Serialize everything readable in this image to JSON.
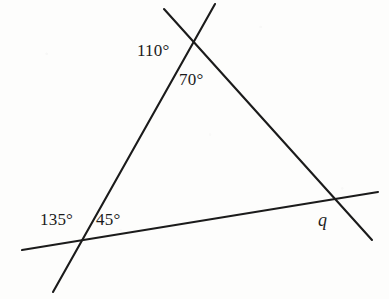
{
  "figure": {
    "kind": "geometry-diagram",
    "width": 389,
    "height": 299,
    "background_color": "#fdfdfc",
    "stroke_color": "#1b1b1b",
    "stroke_width": 2.1
  },
  "points": {
    "apex": {
      "x": 193,
      "y": 48
    },
    "bottom_left_vertex": {
      "x": 80,
      "y": 240
    },
    "right_vertex": {
      "x": 331,
      "y": 200
    },
    "left_line_top_end": {
      "x": 215,
      "y": 4
    },
    "left_line_bottom_end": {
      "x": 53,
      "y": 292
    },
    "right_line_top_end": {
      "x": 164,
      "y": 9
    },
    "right_line_bottom_end": {
      "x": 372,
      "y": 240
    },
    "base_line_left_end": {
      "x": 22,
      "y": 250
    },
    "base_line_right_end": {
      "x": 378,
      "y": 192
    }
  },
  "lines": [
    {
      "name": "left-transversal",
      "description": "steep line from upper right through apex down to lower left",
      "x1": 215,
      "y1": 4,
      "x2": 53,
      "y2": 292
    },
    {
      "name": "right-transversal",
      "description": "line from upper left through apex down to lower right",
      "x1": 164,
      "y1": 9,
      "x2": 372,
      "y2": 240
    },
    {
      "name": "base-transversal",
      "description": "near horizontal line rising slightly to the right",
      "x1": 22,
      "y1": 250,
      "x2": 378,
      "y2": 192
    }
  ],
  "labels": {
    "angle_110": {
      "text": "110°",
      "value": 110,
      "unit": "degrees",
      "x": 137,
      "y": 42
    },
    "angle_70": {
      "text": "70°",
      "value": 70,
      "unit": "degrees",
      "x": 179,
      "y": 71
    },
    "angle_135": {
      "text": "135°",
      "value": 135,
      "unit": "degrees",
      "x": 40,
      "y": 211
    },
    "angle_45": {
      "text": "45°",
      "value": 45,
      "unit": "degrees",
      "x": 96,
      "y": 211
    },
    "unknown_q": {
      "text": "q",
      "style": "italic",
      "x": 318,
      "y": 211
    }
  }
}
